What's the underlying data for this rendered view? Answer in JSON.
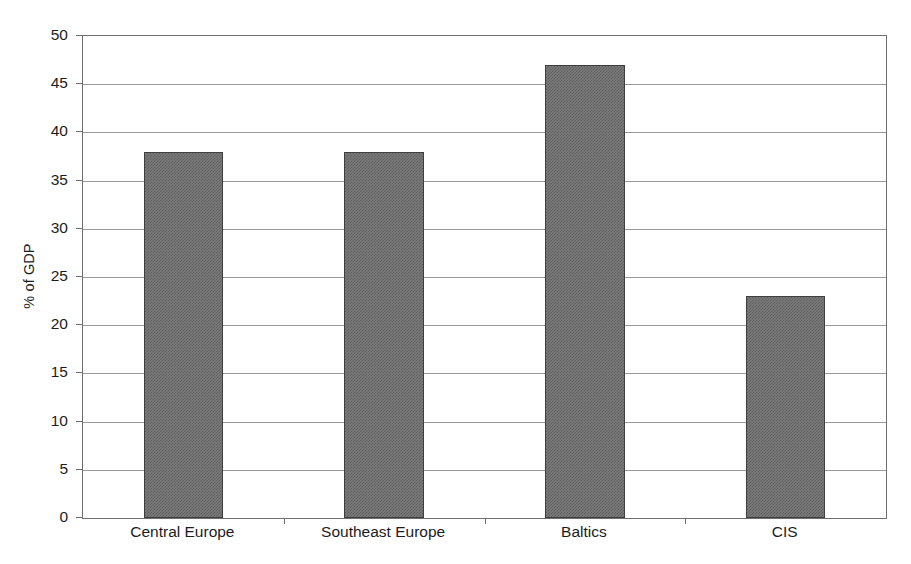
{
  "chart_data": {
    "type": "bar",
    "title": "",
    "subtitle": "",
    "xlabel": "",
    "ylabel": "% of GDP",
    "categories": [
      "Central Europe",
      "Southeast Europe",
      "Baltics",
      "CIS"
    ],
    "values": [
      38,
      38,
      47,
      23
    ],
    "series": [
      {
        "name": "% of GDP",
        "values": [
          38,
          38,
          47,
          23
        ]
      }
    ],
    "ylim": [
      0,
      50
    ],
    "ytick_step": 5,
    "yticks": [
      0,
      5,
      10,
      15,
      20,
      25,
      30,
      35,
      40,
      45,
      50
    ],
    "ytick_labels": [
      "0",
      "5",
      "10",
      "15",
      "20",
      "25",
      "30",
      "35",
      "40",
      "45",
      "50"
    ],
    "grid": {
      "horizontal": true,
      "vertical": false
    },
    "legend": {
      "visible": false,
      "position": "none",
      "entries": []
    },
    "annotations": [],
    "data_labels_visible": false,
    "colors": {
      "bar_fill": "#7b7b7b",
      "bar_border": "#3f3f3f",
      "gridline": "#9a9a9a",
      "axis": "#6e6e6e",
      "text": "#1c1c1c",
      "background": "#ffffff"
    }
  }
}
